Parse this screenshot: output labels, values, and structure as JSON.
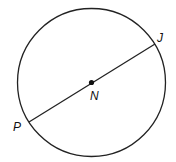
{
  "diagram": {
    "type": "circle-with-diameter",
    "circle": {
      "cx": 91.5,
      "cy": 82.5,
      "r": 74,
      "stroke": "#222222"
    },
    "center_point": {
      "label": "N",
      "x": 91.5,
      "y": 82.5
    },
    "diameter": {
      "from": {
        "label": "P",
        "x": 29,
        "y": 122
      },
      "to": {
        "label": "J",
        "x": 155,
        "y": 44
      }
    },
    "labels": {
      "J": "J",
      "N": "N",
      "P": "P"
    }
  }
}
